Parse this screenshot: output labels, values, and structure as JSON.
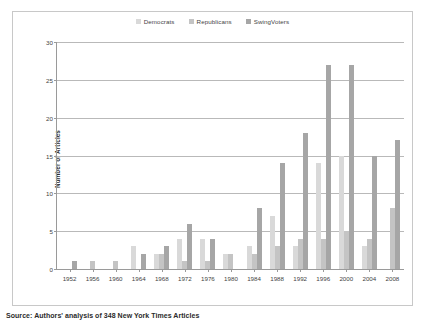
{
  "figure": {
    "source_note": "Source: Authors' analysis of 348 New York Times Articles"
  },
  "legend": {
    "position": "top-center",
    "entries": [
      {
        "label": "Democrats",
        "color": "#d9d9d9",
        "swatch_name": "legend-swatch-democrats"
      },
      {
        "label": "Republicans",
        "color": "#c4c4c4",
        "swatch_name": "legend-swatch-republicans"
      },
      {
        "label": "SwingVoters",
        "color": "#a6a6a6",
        "swatch_name": "legend-swatch-swingvoters"
      }
    ]
  },
  "axes": {
    "y_title": "Number of Articles",
    "y_ticks": [
      "0",
      "5",
      "10",
      "15",
      "20",
      "25",
      "30"
    ],
    "x_ticks": [
      "1952",
      "1956",
      "1960",
      "1964",
      "1968",
      "1972",
      "1976",
      "1980",
      "1984",
      "1988",
      "1992",
      "1996",
      "2000",
      "2004",
      "2008"
    ]
  },
  "chart_data": {
    "type": "bar",
    "title": "",
    "xlabel": "",
    "ylabel": "Number of Articles",
    "ylim": [
      0,
      30
    ],
    "ytick_step": 5,
    "grid": true,
    "legend_position": "top-center",
    "categories": [
      "1952",
      "1956",
      "1960",
      "1964",
      "1968",
      "1972",
      "1976",
      "1980",
      "1984",
      "1988",
      "1992",
      "1996",
      "2000",
      "2004",
      "2008"
    ],
    "series": [
      {
        "name": "Democrats",
        "color": "#d9d9d9",
        "values": [
          0,
          0,
          0,
          3,
          2,
          4,
          4,
          2,
          3,
          7,
          3,
          14,
          15,
          3,
          0
        ]
      },
      {
        "name": "Republicans",
        "color": "#c4c4c4",
        "values": [
          0,
          1,
          1,
          0,
          2,
          1,
          1,
          2,
          2,
          3,
          4,
          4,
          5,
          4,
          8
        ]
      },
      {
        "name": "SwingVoters",
        "color": "#a6a6a6",
        "values": [
          1,
          0,
          0,
          2,
          3,
          6,
          4,
          0,
          8,
          14,
          18,
          27,
          27,
          15,
          17
        ]
      }
    ],
    "source": "Source: Authors' analysis of 348 New York Times Articles"
  }
}
